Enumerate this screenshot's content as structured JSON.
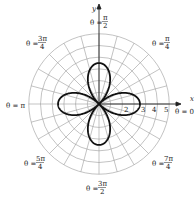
{
  "chart_data": {
    "type": "polar",
    "title": "",
    "equation_shape": "four-petaled rose",
    "curve": {
      "form": "r = a cos(2θ)",
      "a": 3.5,
      "petals": 4,
      "petal_directions": [
        "θ = 0",
        "θ = π/2",
        "θ = π",
        "θ = 3π/2"
      ]
    },
    "radial_rings": [
      1,
      2,
      3,
      4,
      5,
      6
    ],
    "radial_tick_labels": [
      "2",
      "3",
      "4",
      "5"
    ],
    "radial_tick_values": [
      2,
      3,
      4,
      5
    ],
    "angular_gridline_step_deg": 15,
    "axis_labels": {
      "x": "x",
      "y": "y"
    },
    "angle_labels": [
      {
        "text": "θ = π/2",
        "angle_deg": 90
      },
      {
        "text": "θ = π/4",
        "angle_deg": 45
      },
      {
        "text": "θ = 0",
        "angle_deg": 0
      },
      {
        "text": "θ = 7π/4",
        "angle_deg": 315
      },
      {
        "text": "θ = 3π/2",
        "angle_deg": 270
      },
      {
        "text": "θ = 5π/4",
        "angle_deg": 225
      },
      {
        "text": "θ = π",
        "angle_deg": 180
      },
      {
        "text": "θ = 3π/4",
        "angle_deg": 135
      }
    ],
    "grid": true
  },
  "labels": {
    "x_axis": "x",
    "y_axis": "y",
    "theta_eq": "θ =",
    "a90_num": "π",
    "a90_den": "2",
    "a45_num": "π",
    "a45_den": "4",
    "a0": "θ = 0",
    "a315_num": "7π",
    "a315_den": "4",
    "a270_num": "3π",
    "a270_den": "2",
    "a225_num": "5π",
    "a225_den": "4",
    "a180": "θ = π",
    "a135_num": "3π",
    "a135_den": "4",
    "t2": "2",
    "t3": "3",
    "t4": "4",
    "t5": "5"
  }
}
